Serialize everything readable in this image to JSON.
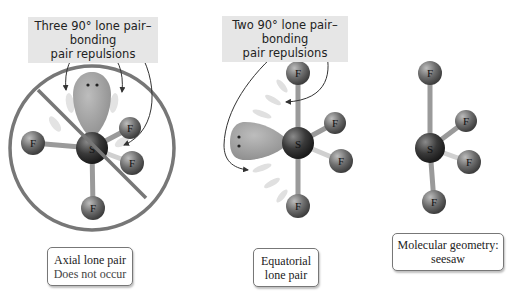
{
  "panels": [
    {
      "id": "axial",
      "title": [
        "Three 90° lone pair–bonding",
        "pair repulsions"
      ],
      "label": [
        "Axial lone pair",
        "Does not occur"
      ],
      "central_atom": "S",
      "terminal_atoms": [
        "F",
        "F",
        "F",
        "F"
      ],
      "crossed_out": true
    },
    {
      "id": "equatorial",
      "title": [
        "Two 90° lone pair–bonding",
        "pair repulsions"
      ],
      "label": [
        "Equatorial",
        "lone pair"
      ],
      "central_atom": "S",
      "terminal_atoms": [
        "F",
        "F",
        "F",
        "F"
      ],
      "crossed_out": false
    },
    {
      "id": "seesaw",
      "label": [
        "Molecular geometry:",
        "seesaw"
      ],
      "central_atom": "S",
      "terminal_atoms": [
        "F",
        "F",
        "F",
        "F"
      ]
    }
  ],
  "colors": {
    "title_bg": "#e6e6e6",
    "sphere_dark": "#333333",
    "sphere_mid": "#777777",
    "lone_pair": "#9a9a9a",
    "prohibition": "#777777"
  }
}
